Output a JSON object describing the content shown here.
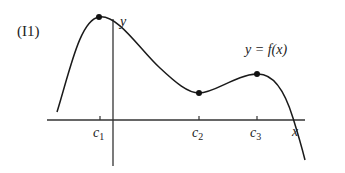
{
  "figure": {
    "label": "(I1)",
    "function_label": "y = f(x)",
    "axes": {
      "x_label": "x",
      "y_label": "y"
    },
    "ticks": [
      {
        "name": "c1",
        "base": "c",
        "sub": "1"
      },
      {
        "name": "c2",
        "base": "c",
        "sub": "2"
      },
      {
        "name": "c3",
        "base": "c",
        "sub": "3"
      }
    ],
    "critical_points": [
      {
        "at": "c1",
        "type": "local maximum"
      },
      {
        "at": "c2",
        "type": "local minimum"
      },
      {
        "at": "c3",
        "type": "local maximum"
      }
    ],
    "colors": {
      "curve": "#1a1a1a",
      "axes": "#333333",
      "points": "#111111",
      "background": "#ffffff"
    }
  }
}
